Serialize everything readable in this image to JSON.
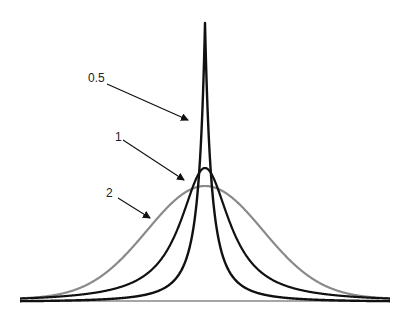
{
  "chart_data": {
    "type": "line",
    "title": "",
    "xlabel": "",
    "ylabel": "",
    "grid": false,
    "legend": "none",
    "baseline": {
      "x1": 20,
      "x2": 390,
      "y": 301,
      "color": "#888888"
    },
    "center_x": 205,
    "series": [
      {
        "name": "2",
        "color": "#8a8a8a",
        "width": 2.2,
        "kind": "gauss",
        "peak_y": 186,
        "sigma": 58,
        "floor_y": 299
      },
      {
        "name": "1",
        "color": "#111111",
        "width": 2.2,
        "kind": "cauchy",
        "peak_y": 168,
        "gamma": 30,
        "floor_y": 302
      },
      {
        "name": "0.5",
        "color": "#111111",
        "width": 2.4,
        "kind": "sharp",
        "peak_y": 23,
        "gamma": 14,
        "floor_y": 302
      }
    ],
    "annotations": [
      {
        "text": "0.5",
        "tx": 88,
        "ty": 82,
        "x1": 107,
        "y1": 84,
        "x2": 188,
        "y2": 120
      },
      {
        "text": "1",
        "tx": 115,
        "ty": 141,
        "x1": 123,
        "y1": 140,
        "x2": 184,
        "y2": 180
      },
      {
        "text": "2",
        "tx": 106,
        "ty": 197,
        "x1": 118,
        "y1": 198,
        "x2": 150,
        "y2": 218
      }
    ]
  }
}
